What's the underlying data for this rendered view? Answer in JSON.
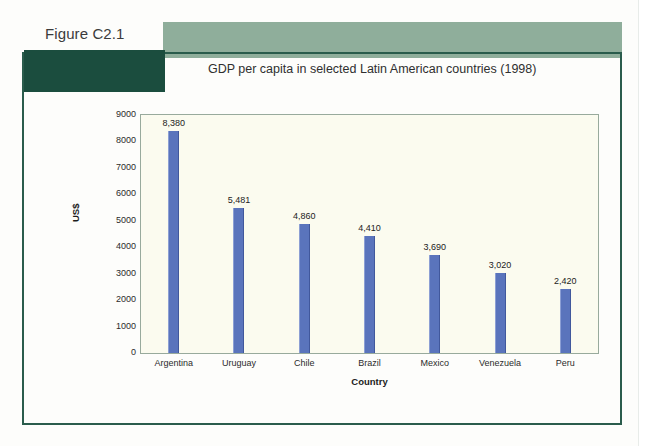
{
  "figure": {
    "label": "Figure C2.1",
    "title": "GDP per capita in selected Latin American countries (1998)"
  },
  "colors": {
    "band_light": "#8fae9b",
    "band_dark": "#1b4d3e",
    "frame": "#2a5c4c",
    "bar": "#5a74bc",
    "plot_background": "#fbfbef",
    "plot_border": "#98aa9c"
  },
  "chart_data": {
    "type": "bar",
    "title": "GDP per capita in selected Latin American countries (1998)",
    "xlabel": "Country",
    "ylabel": "US$",
    "ylim": [
      0,
      9000
    ],
    "ytick_step": 1000,
    "yticks": [
      "9000",
      "8000",
      "7000",
      "6000",
      "5000",
      "4000",
      "3000",
      "2000",
      "1000",
      "0"
    ],
    "grid": false,
    "legend": false,
    "categories": [
      "Argentina",
      "Uruguay",
      "Chile",
      "Brazil",
      "Mexico",
      "Venezuela",
      "Peru"
    ],
    "values": [
      8380,
      5481,
      4860,
      4410,
      3690,
      3020,
      2420
    ],
    "value_labels": [
      "8,380",
      "5,481",
      "4,860",
      "4,410",
      "3,690",
      "3,020",
      "2,420"
    ]
  }
}
